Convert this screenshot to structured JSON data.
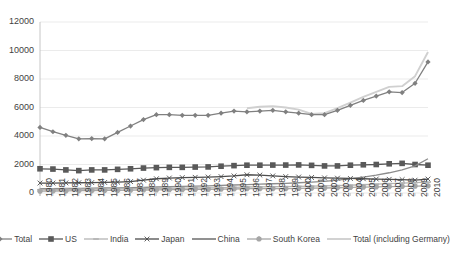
{
  "chart_data": {
    "type": "line",
    "title": "",
    "xlabel": "",
    "ylabel": "",
    "ylim": [
      0,
      12000
    ],
    "ytick_step": 2000,
    "yticks": [
      "0",
      "2000",
      "4000",
      "6000",
      "8000",
      "10000",
      "12000"
    ],
    "grid": true,
    "legend_position": "bottom",
    "categories": [
      "1980",
      "1981",
      "1982",
      "1983",
      "1984",
      "1985",
      "1986",
      "1987",
      "1988",
      "1989",
      "1990",
      "1991",
      "1992",
      "1993",
      "1994",
      "1995",
      "1996",
      "1997",
      "1998",
      "1999",
      "2000",
      "2001",
      "2002",
      "2003",
      "2004",
      "2005",
      "2006",
      "2007",
      "2008",
      "2009",
      "2010"
    ],
    "series": [
      {
        "name": "Total",
        "color": "#808080",
        "marker": "diamond",
        "values": [
          4600,
          4300,
          4050,
          3800,
          3820,
          3800,
          4250,
          4700,
          5150,
          5500,
          5500,
          5450,
          5450,
          5450,
          5600,
          5750,
          5700,
          5750,
          5800,
          5700,
          5600,
          5500,
          5500,
          5800,
          6150,
          6500,
          6800,
          7100,
          7050,
          7700,
          9200
        ]
      },
      {
        "name": "US",
        "color": "#595959",
        "marker": "square",
        "values": [
          1700,
          1680,
          1620,
          1570,
          1620,
          1620,
          1660,
          1700,
          1750,
          1780,
          1800,
          1800,
          1820,
          1830,
          1880,
          1920,
          1950,
          1950,
          1960,
          1960,
          1970,
          1940,
          1900,
          1900,
          1950,
          1980,
          2000,
          2050,
          2080,
          2000,
          1950
        ]
      },
      {
        "name": "India",
        "color": "#b3b3b3",
        "marker": "dash",
        "values": [
          230,
          240,
          250,
          260,
          270,
          280,
          290,
          300,
          310,
          320,
          330,
          340,
          350,
          360,
          380,
          400,
          420,
          430,
          440,
          450,
          470,
          480,
          500,
          520,
          550,
          580,
          620,
          660,
          700,
          730,
          760
        ]
      },
      {
        "name": "Japan",
        "color": "#4d4d4d",
        "marker": "x",
        "values": [
          700,
          700,
          710,
          720,
          730,
          740,
          760,
          800,
          900,
          1000,
          1050,
          1080,
          1100,
          1120,
          1150,
          1200,
          1280,
          1260,
          1200,
          1150,
          1120,
          1090,
          1060,
          1040,
          1020,
          1000,
          980,
          960,
          940,
          900,
          980
        ]
      },
      {
        "name": "China",
        "color": "#8c8c8c",
        "marker": "none",
        "values": [
          300,
          310,
          320,
          330,
          340,
          350,
          360,
          380,
          400,
          420,
          440,
          460,
          480,
          500,
          530,
          560,
          590,
          620,
          650,
          680,
          720,
          760,
          820,
          900,
          1010,
          1120,
          1250,
          1420,
          1620,
          1900,
          2400
        ]
      },
      {
        "name": "South Korea",
        "color": "#a6a6a6",
        "marker": "heptagon",
        "values": [
          130,
          140,
          150,
          160,
          170,
          180,
          190,
          200,
          210,
          220,
          230,
          240,
          250,
          260,
          270,
          280,
          300,
          310,
          300,
          310,
          330,
          340,
          350,
          370,
          390,
          410,
          430,
          450,
          470,
          480,
          500
        ]
      },
      {
        "name": "Total (including Germany)",
        "color": "#d0d0d0",
        "marker": "none",
        "start_index": 16,
        "values": [
          null,
          null,
          null,
          null,
          null,
          null,
          null,
          null,
          null,
          null,
          null,
          null,
          null,
          null,
          null,
          null,
          5950,
          6050,
          6100,
          6000,
          5850,
          5550,
          5600,
          5950,
          6350,
          6750,
          7100,
          7450,
          7500,
          8200,
          9900
        ]
      }
    ]
  },
  "axes": {
    "x_tick_labels": [
      "1980",
      "1981",
      "1982",
      "1983",
      "1984",
      "1985",
      "1986",
      "1987",
      "1988",
      "1989",
      "1990",
      "1991",
      "1992",
      "1993",
      "1994",
      "1995",
      "1996",
      "1997",
      "1998",
      "1999",
      "2000",
      "2001",
      "2002",
      "2003",
      "2004",
      "2005",
      "2006",
      "2007",
      "2008",
      "2009",
      "2010"
    ],
    "y_tick_labels": [
      "12000",
      "10000",
      "8000",
      "6000",
      "4000",
      "2000",
      "0"
    ]
  },
  "legend": {
    "items": [
      {
        "label": "Total",
        "color": "#808080",
        "marker": "diamond"
      },
      {
        "label": "US",
        "color": "#595959",
        "marker": "square"
      },
      {
        "label": "India",
        "color": "#b3b3b3",
        "marker": "dash"
      },
      {
        "label": "Japan",
        "color": "#4d4d4d",
        "marker": "x"
      },
      {
        "label": "China",
        "color": "#8c8c8c",
        "marker": "none"
      },
      {
        "label": "South Korea",
        "color": "#a6a6a6",
        "marker": "heptagon"
      },
      {
        "label": "Total (including Germany)",
        "color": "#d0d0d0",
        "marker": "none"
      }
    ]
  },
  "style": {
    "background": "#ffffff",
    "grid_color": "#e6e6e6",
    "axis_color": "#bfbfbf",
    "text_color": "#3f3f3f"
  }
}
